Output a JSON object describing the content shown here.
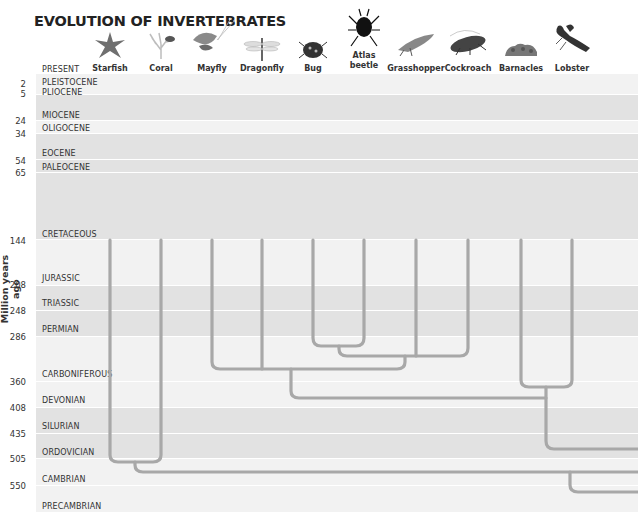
{
  "title": "EVOLUTION OF INVERTEBRATES",
  "axis_label": "Million years ago",
  "present_label": "PRESENT",
  "colors": {
    "line": "#a8a8a8",
    "band_light": "#f2f2f2",
    "band_dark": "#e2e2e2",
    "text": "#333333"
  },
  "animals": [
    {
      "name": "Starfish",
      "x": 110,
      "icon": "starfish-icon"
    },
    {
      "name": "Coral",
      "x": 161,
      "icon": "coral-icon"
    },
    {
      "name": "Mayfly",
      "x": 212,
      "icon": "mayfly-icon"
    },
    {
      "name": "Dragonfly",
      "x": 262,
      "icon": "dragonfly-icon"
    },
    {
      "name": "Bug",
      "x": 313,
      "icon": "bug-icon"
    },
    {
      "name": "Atlas beetle",
      "line1": "Atlas",
      "line2": "beetle",
      "x": 364,
      "icon": "atlas-beetle-icon"
    },
    {
      "name": "Grasshopper",
      "x": 416,
      "icon": "grasshopper-icon"
    },
    {
      "name": "Cockroach",
      "x": 468,
      "icon": "cockroach-icon"
    },
    {
      "name": "Barnacles",
      "x": 521,
      "icon": "barnacles-icon"
    },
    {
      "name": "Lobster",
      "x": 572,
      "icon": "lobster-icon"
    }
  ],
  "eras": [
    {
      "name": "PLEISTOCENE",
      "label_y": 78
    },
    {
      "name": "PLIOCENE",
      "label_y": 88
    },
    {
      "name": "MIOCENE",
      "label_y": 111
    },
    {
      "name": "OLIGOCENE",
      "label_y": 124
    },
    {
      "name": "EOCENE",
      "label_y": 149
    },
    {
      "name": "PALEOCENE",
      "label_y": 163
    },
    {
      "name": "CRETACEOUS",
      "label_y": 230
    },
    {
      "name": "JURASSIC",
      "label_y": 274
    },
    {
      "name": "TRIASSIC",
      "label_y": 299
    },
    {
      "name": "PERMIAN",
      "label_y": 325
    },
    {
      "name": "CARBONIFEROUS",
      "label_y": 370
    },
    {
      "name": "DEVONIAN",
      "label_y": 396
    },
    {
      "name": "SILURIAN",
      "label_y": 422
    },
    {
      "name": "ORDOVICIAN",
      "label_y": 448
    },
    {
      "name": "CAMBRIAN",
      "label_y": 475
    },
    {
      "name": "PRECAMBRIAN",
      "label_y": 502
    }
  ],
  "ticks": [
    {
      "value": "2",
      "y": 79
    },
    {
      "value": "5",
      "y": 89
    },
    {
      "value": "24",
      "y": 116
    },
    {
      "value": "34",
      "y": 129
    },
    {
      "value": "54",
      "y": 156
    },
    {
      "value": "65",
      "y": 168
    },
    {
      "value": "144",
      "y": 236
    },
    {
      "value": "208",
      "y": 280
    },
    {
      "value": "248",
      "y": 306
    },
    {
      "value": "286",
      "y": 332
    },
    {
      "value": "360",
      "y": 377
    },
    {
      "value": "408",
      "y": 403
    },
    {
      "value": "435",
      "y": 429
    },
    {
      "value": "505",
      "y": 454
    },
    {
      "value": "550",
      "y": 481
    }
  ],
  "bands": [
    {
      "top": 74,
      "height": 20,
      "shade": "light"
    },
    {
      "top": 95,
      "height": 25,
      "shade": "dark"
    },
    {
      "top": 121,
      "height": 12,
      "shade": "light"
    },
    {
      "top": 134,
      "height": 25,
      "shade": "dark"
    },
    {
      "top": 160,
      "height": 12,
      "shade": "dark"
    },
    {
      "top": 173,
      "height": 66,
      "shade": "dark"
    },
    {
      "top": 240,
      "height": 45,
      "shade": "light"
    },
    {
      "top": 286,
      "height": 24,
      "shade": "dark"
    },
    {
      "top": 311,
      "height": 25,
      "shade": "dark"
    },
    {
      "top": 337,
      "height": 44,
      "shade": "light"
    },
    {
      "top": 382,
      "height": 25,
      "shade": "light"
    },
    {
      "top": 408,
      "height": 25,
      "shade": "dark"
    },
    {
      "top": 434,
      "height": 24,
      "shade": "dark"
    },
    {
      "top": 459,
      "height": 26,
      "shade": "light"
    },
    {
      "top": 486,
      "height": 26,
      "shade": "light"
    }
  ],
  "tree": {
    "description": "Phylogenetic tree joining animals by common ancestors",
    "joins": [
      {
        "members": [
          "Bug",
          "Atlas beetle"
        ],
        "y": 346
      },
      {
        "members": [
          "Bug+Atlas beetle",
          "Grasshopper"
        ],
        "y": 356
      },
      {
        "members": [
          "Bug+Atlas beetle+Grasshopper",
          "Cockroach"
        ],
        "y": 356
      },
      {
        "members": [
          "Mayfly",
          "Dragonfly"
        ],
        "y": 369
      },
      {
        "members": [
          "Mayfly+Dragonfly",
          "Beetles/Bugs/Cockroach group"
        ],
        "y": 369
      },
      {
        "members": [
          "Barnacles",
          "Lobster"
        ],
        "y": 387
      },
      {
        "members": [
          "Insects",
          "Crustaceans"
        ],
        "y": 398
      },
      {
        "members": [
          "Arthropods",
          "Outgroup right"
        ],
        "y": 449
      },
      {
        "members": [
          "Starfish",
          "Coral"
        ],
        "y": 462
      },
      {
        "members": [
          "Starfish+Coral",
          "All others"
        ],
        "y": 472
      },
      {
        "members": [
          "Root branch right"
        ],
        "y": 492
      }
    ]
  }
}
